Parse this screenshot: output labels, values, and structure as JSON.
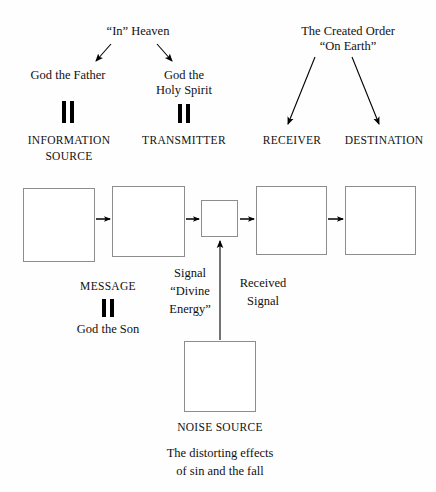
{
  "diagram": {
    "title_hidden": "",
    "headers": {
      "heaven": "“In” Heaven",
      "earth_line1": "The Created Order",
      "earth_line2": "“On Earth”"
    },
    "persons": {
      "father": "God the Father",
      "holy_spirit_line1": "God the",
      "holy_spirit_line2": "Holy Spirit",
      "son": "God the Son"
    },
    "stages": [
      {
        "id": "information-source",
        "label_line1": "INFORMATION",
        "label_line2": "SOURCE"
      },
      {
        "id": "transmitter",
        "label_line1": "TRANSMITTER",
        "label_line2": ""
      },
      {
        "id": "receiver",
        "label_line1": "RECEIVER",
        "label_line2": ""
      },
      {
        "id": "destination",
        "label_line1": "DESTINATION",
        "label_line2": ""
      }
    ],
    "middle_labels": {
      "message": "MESSAGE",
      "signal_line1": "Signal",
      "signal_line2": "“Divine",
      "signal_line3": "Energy”",
      "received_line1": "Received",
      "received_line2": "Signal"
    },
    "noise": {
      "label": "NOISE SOURCE",
      "caption_line1": "The distorting effects",
      "caption_line2": "of sin and the fall"
    },
    "colors": {
      "box_border": "#8d8d8d",
      "text": "#111111",
      "arrow": "#000000",
      "background": "#fefefe"
    }
  }
}
